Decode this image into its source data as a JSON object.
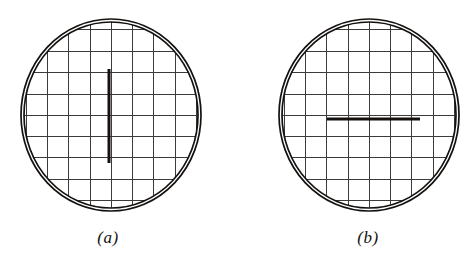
{
  "figure": {
    "background_color": "#ffffff",
    "ink_color": "#14110f",
    "grid_color": "#3b3b3b",
    "panels": [
      {
        "id": "a",
        "caption": "(a)",
        "aperture": {
          "center_x": 111,
          "center_y": 115,
          "radius_x": 90,
          "radius_y": 96,
          "outer_ring_width": 1.6,
          "inner_ring_width": 1.6,
          "ring_gap": 3
        },
        "grid": {
          "spacing": 21.4,
          "line_width": 1.0,
          "origin_x": 111,
          "origin_y": 115
        },
        "mark": {
          "type": "line",
          "orientation": "vertical",
          "x1": 109,
          "y1": 69,
          "x2": 109,
          "y2": 163,
          "line_width": 3.0,
          "length_px": 94
        }
      },
      {
        "id": "b",
        "caption": "(b)",
        "aperture": {
          "center_x": 369,
          "center_y": 115,
          "radius_x": 90,
          "radius_y": 96,
          "outer_ring_width": 1.6,
          "inner_ring_width": 1.6,
          "ring_gap": 3
        },
        "grid": {
          "spacing": 21.4,
          "line_width": 1.0,
          "origin_x": 369,
          "origin_y": 115
        },
        "mark": {
          "type": "line",
          "orientation": "horizontal",
          "x1": 327,
          "y1": 119,
          "x2": 420,
          "y2": 119,
          "line_width": 3.0,
          "length_px": 93
        }
      }
    ]
  }
}
